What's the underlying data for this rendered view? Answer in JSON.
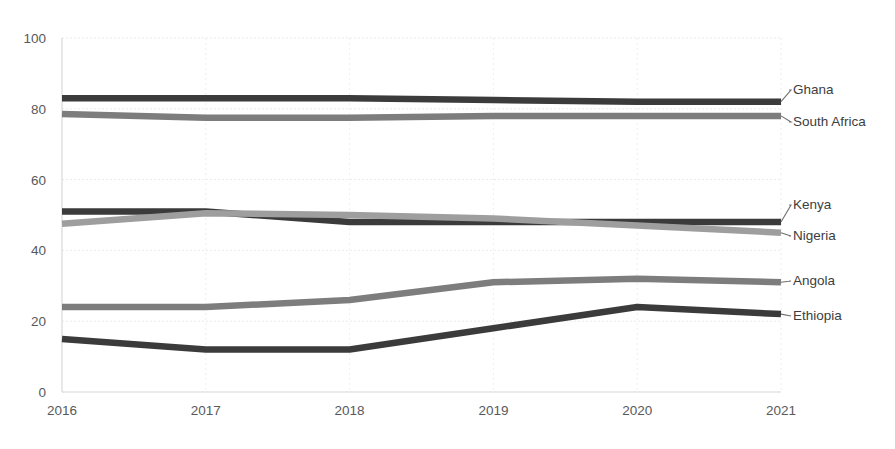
{
  "chart_data": {
    "type": "line",
    "title": "",
    "xlabel": "",
    "ylabel": "",
    "categories": [
      "2016",
      "2017",
      "2018",
      "2019",
      "2020",
      "2021"
    ],
    "x": [
      2016,
      2017,
      2018,
      2019,
      2020,
      2021
    ],
    "ylim": [
      0,
      100
    ],
    "yticks": [
      0,
      20,
      40,
      60,
      80,
      100
    ],
    "ytick_labels": [
      "0",
      "20",
      "40",
      "60",
      "80",
      "100"
    ],
    "grid": true,
    "legend_position": "right-inline-labels",
    "series": [
      {
        "name": "Ghana",
        "color": "#3b3b3b",
        "label_y": 90,
        "values": [
          83,
          83,
          83,
          82.5,
          82,
          82
        ]
      },
      {
        "name": "South Africa",
        "color": "#7d7d7d",
        "label_y": 122,
        "values": [
          78.5,
          77.5,
          77.5,
          78,
          78,
          78
        ]
      },
      {
        "name": "Kenya",
        "color": "#3b3b3b",
        "label_y": 205,
        "values": [
          51,
          51,
          48,
          48,
          48,
          48
        ]
      },
      {
        "name": "Nigeria",
        "color": "#9e9e9e",
        "label_y": 236,
        "values": [
          47.5,
          50.5,
          50,
          49,
          47,
          45
        ]
      },
      {
        "name": "Angola",
        "color": "#7d7d7d",
        "label_y": 281,
        "values": [
          24,
          24,
          26,
          31,
          32,
          31
        ]
      },
      {
        "name": "Ethiopia",
        "color": "#3b3b3b",
        "label_y": 316,
        "values": [
          15,
          12,
          12,
          18,
          24,
          22
        ]
      }
    ]
  },
  "axis": {
    "y_labels": [
      "100",
      "80",
      "60",
      "40",
      "20",
      "0"
    ],
    "x_labels": [
      "2016",
      "2017",
      "2018",
      "2019",
      "2020",
      "2021"
    ]
  },
  "series_labels": {
    "ghana": "Ghana",
    "south_africa": "South Africa",
    "kenya": "Kenya",
    "nigeria": "Nigeria",
    "angola": "Angola",
    "ethiopia": "Ethiopia"
  }
}
